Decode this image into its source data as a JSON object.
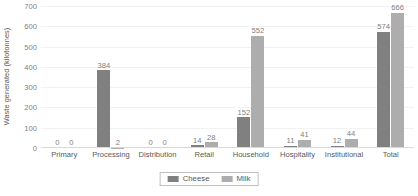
{
  "chart_data": {
    "type": "bar",
    "title": "",
    "subtitle": "",
    "xlabel": "",
    "ylabel": "Waste generated (kilotonnes)",
    "categories": [
      "Primary",
      "Processing",
      "Distribution",
      "Retail",
      "Household",
      "Hospitality",
      "Institutional",
      "Total"
    ],
    "series": [
      {
        "name": "Cheese",
        "color": "#808080",
        "values": [
          0,
          384,
          0,
          14,
          152,
          11,
          12,
          574
        ]
      },
      {
        "name": "Milk",
        "color": "#adadad",
        "values": [
          0,
          2,
          0,
          28,
          552,
          41,
          44,
          666
        ]
      }
    ],
    "ylim": [
      0,
      700
    ],
    "yticks": [
      0,
      100,
      200,
      300,
      400,
      500,
      600,
      700
    ],
    "ytick_labels": [
      "0",
      "100",
      "200",
      "300",
      "400",
      "500",
      "600",
      "700"
    ],
    "grid": true,
    "grid_axis": "y",
    "legend_position": "bottom",
    "data_labels": true
  },
  "legend": {
    "items": [
      {
        "label": "Cheese",
        "swatch": "cheese-swatch"
      },
      {
        "label": "Milk",
        "swatch": "milk-swatch"
      }
    ]
  },
  "colors": {
    "cheese": "#808080",
    "milk": "#adadad",
    "gridline": "#f2f2f2",
    "axis": "#d9d9d9",
    "text": "#595959",
    "tick_text": "#7f7f7f"
  }
}
